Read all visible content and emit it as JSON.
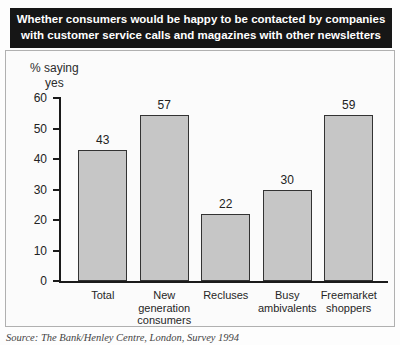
{
  "title": {
    "text": "Whether consumers would be happy to be contacted by companies\nwith customer service calls and magazines with other newsletters"
  },
  "y_axis": {
    "label": "% saying\nyes"
  },
  "source": {
    "text": "Source: The Bank/Henley Centre, London, Survey 1994"
  },
  "colors": {
    "title_bg": "#161616",
    "title_text": "#ffffff",
    "bar_fill": "#c6c6c6",
    "bar_border": "#333333",
    "axis": "#1a1a1a",
    "panel_border": "#b0b0b0",
    "panel_bg": "#fbfbfb"
  },
  "chart_data": {
    "type": "bar",
    "title": "Whether consumers would be happy to be contacted by companies with customer service calls and magazines with other newsletters",
    "categories": [
      "Total",
      "New generation consumers",
      "Recluses",
      "Busy ambivalents",
      "Freemarket shoppers"
    ],
    "category_display": [
      "Total",
      "New\ngeneration\nconsumers",
      "Recluses",
      "Busy\nambivalents",
      "Freemarket\nshoppers"
    ],
    "values": [
      43,
      57,
      22,
      30,
      59
    ],
    "xlabel": "",
    "ylabel": "% saying yes",
    "ylim": [
      0,
      60
    ],
    "yticks": [
      0,
      10,
      20,
      30,
      40,
      50,
      60
    ],
    "grid": false,
    "legend": false
  }
}
